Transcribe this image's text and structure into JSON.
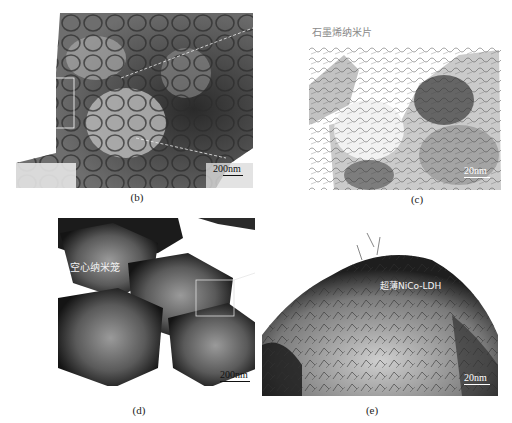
{
  "figure": {
    "panels": [
      {
        "id": "b",
        "caption": "(b)",
        "scale_bar": "200nm",
        "description": "TEM image of aggregated hollow polyhedral nanocages with zoom-inset box and dashed guide lines"
      },
      {
        "id": "c",
        "caption": "(c)",
        "scale_bar": "20nm",
        "annotation": "石墨烯纳米片",
        "description": "High-magnification TEM showing crumpled graphene nanosheets"
      },
      {
        "id": "d",
        "caption": "(d)",
        "scale_bar": "200nm",
        "annotation": "空心纳米笼",
        "description": "TEM image of four hollow polyhedral nanocages with a selection box"
      },
      {
        "id": "e",
        "caption": "(e)",
        "scale_bar": "20nm",
        "annotation": "超薄NiCo-LDH",
        "description": "High-magnification TEM of nanocage shell covered with ultrathin NiCo-LDH nanosheets"
      }
    ]
  }
}
